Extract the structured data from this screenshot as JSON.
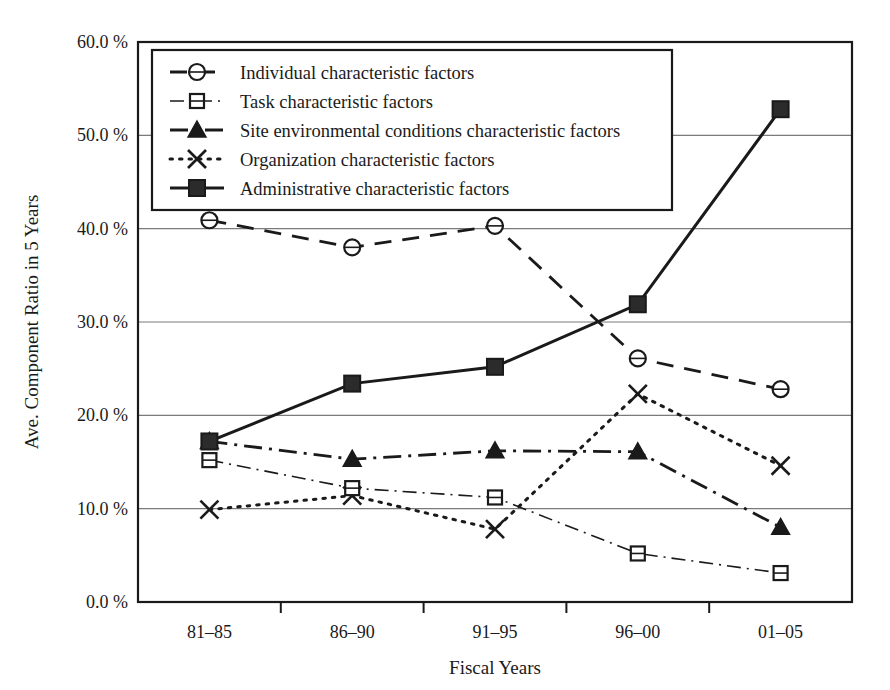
{
  "chart_data": {
    "type": "line",
    "title": "",
    "xlabel": "Fiscal Years",
    "ylabel": "Ave. Component Ratio in 5 Years",
    "categories": [
      "81–85",
      "86–90",
      "91–95",
      "96–00",
      "01–05"
    ],
    "ylim": [
      0.0,
      60.0
    ],
    "ytick_values": [
      0.0,
      10.0,
      20.0,
      30.0,
      40.0,
      50.0,
      60.0
    ],
    "ytick_labels": [
      "0.0 %",
      "10.0 %",
      "20.0 %",
      "30.0 %",
      "40.0 %",
      "50.0 %",
      "60.0 %"
    ],
    "grid": true,
    "grid_axis": "y",
    "legend_position": "upper-left",
    "unit": "%",
    "series": [
      {
        "name": "Individual characteristic factors",
        "marker": "circle-open",
        "dash": "dashed",
        "color": "#1a1a1a",
        "values": [
          40.9,
          38.0,
          40.3,
          26.1,
          22.8
        ]
      },
      {
        "name": "Task characteristic factors",
        "marker": "square-open",
        "dash": "dash-dot-thin",
        "color": "#1a1a1a",
        "values": [
          15.2,
          12.2,
          11.2,
          5.2,
          3.1
        ]
      },
      {
        "name": "Site environmental conditions characteristic factors",
        "marker": "triangle-filled",
        "dash": "dash-dot",
        "color": "#1a1a1a",
        "values": [
          17.2,
          15.3,
          16.2,
          16.1,
          8.0
        ]
      },
      {
        "name": "Organization characteristic factors",
        "marker": "x-cross",
        "dash": "dotted",
        "color": "#1a1a1a",
        "values": [
          9.9,
          11.4,
          7.8,
          22.3,
          14.6
        ]
      },
      {
        "name": "Administrative characteristic factors",
        "marker": "square-filled",
        "dash": "solid",
        "color": "#1a1a1a",
        "values": [
          17.2,
          23.4,
          25.2,
          31.9,
          52.8
        ]
      }
    ]
  }
}
